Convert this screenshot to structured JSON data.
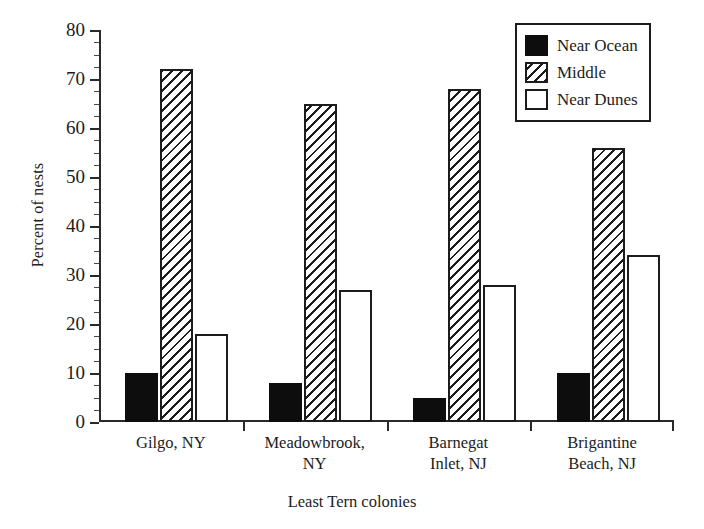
{
  "chart_data": {
    "type": "bar",
    "title": "",
    "xlabel": "Least Tern colonies",
    "ylabel": "Percent of nests",
    "ylim": [
      0,
      80
    ],
    "ytick_step": 10,
    "yminor_step": 2.5,
    "grid": false,
    "legend_position": "top-right",
    "categories": [
      "Gilgo, NY",
      "Meadowbrook, NY",
      "Barnegat Inlet, NJ",
      "Brigantine Beach, NJ"
    ],
    "category_lines": [
      [
        "Gilgo, NY"
      ],
      [
        "Meadowbrook,",
        "NY"
      ],
      [
        "Barnegat",
        "Inlet, NJ"
      ],
      [
        "Brigantine",
        "Beach, NJ"
      ]
    ],
    "ytick_labels": [
      "0",
      "10",
      "20",
      "30",
      "40",
      "50",
      "60",
      "70",
      "80"
    ],
    "ytick_values": [
      0,
      10,
      20,
      30,
      40,
      50,
      60,
      70,
      80
    ],
    "series": [
      {
        "name": "Near Ocean",
        "fill": "solid-black",
        "color": "#0d0d0d",
        "values": [
          10,
          8,
          5,
          10
        ]
      },
      {
        "name": "Middle",
        "fill": "diagonal-hatch",
        "color": "#1c1c1c",
        "values": [
          72,
          65,
          68,
          56
        ]
      },
      {
        "name": "Near Dunes",
        "fill": "open-white",
        "color": "#ffffff",
        "values": [
          18,
          27,
          28,
          34
        ]
      }
    ]
  },
  "legend": {
    "items": [
      {
        "label": "Near Ocean",
        "swatch": "solid-black-swatch"
      },
      {
        "label": "Middle",
        "swatch": "hatched-swatch"
      },
      {
        "label": "Near Dunes",
        "swatch": "open-white-swatch"
      }
    ]
  },
  "axes": {
    "y_title": "Percent of nests",
    "x_title": "Least Tern colonies"
  }
}
